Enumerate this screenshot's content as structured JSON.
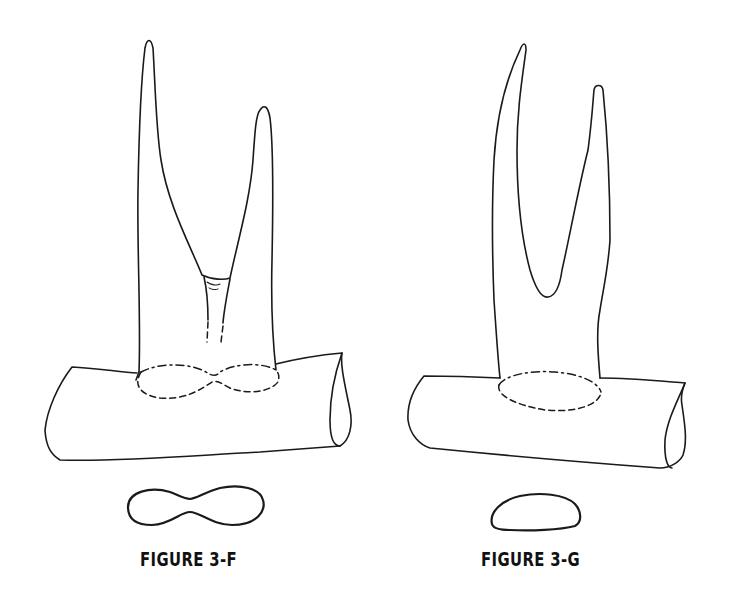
{
  "figures": [
    {
      "id": "3-F",
      "caption": "FIGURE 3-F",
      "description": "Forked antler tine attached to a log; base outline shown with dashed figure-eight; cross-section below is a figure-eight shape"
    },
    {
      "id": "3-G",
      "caption": "FIGURE 3-G",
      "description": "Forked antler tine with a deep U-shaped crotch attached to a log; base outline shown as dashed oval; cross-section below is an oval/egg shape"
    }
  ],
  "colors": {
    "line": "#1a1a1a",
    "background": "#ffffff"
  }
}
